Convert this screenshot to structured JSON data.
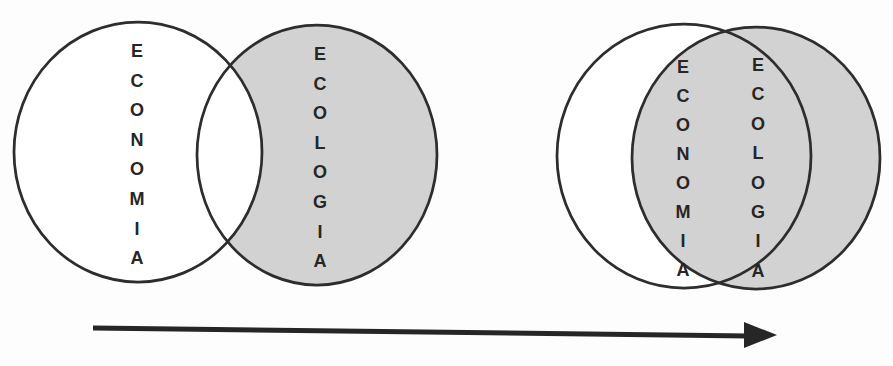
{
  "figure": {
    "type": "venn-evolution-diagram",
    "stages": [
      {
        "id": "separated",
        "circles": [
          {
            "label": "ECONOMIA",
            "fill": "white"
          },
          {
            "label": "ECOLOGIA",
            "fill": "shaded"
          }
        ]
      },
      {
        "id": "integrated",
        "circles": [
          {
            "label": "ECONOMIA",
            "fill": "white"
          },
          {
            "label": "ECOLOGIA",
            "fill": "shaded"
          }
        ]
      }
    ],
    "arrow": {
      "icon": "right-arrow-icon",
      "direction": "right"
    },
    "colors": {
      "shade": "#d2d2d2",
      "outline": "#2d2d2d",
      "ink": "#262626",
      "background": "#fdfdfd"
    }
  }
}
